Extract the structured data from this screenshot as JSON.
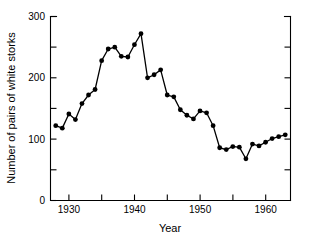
{
  "chart_data": {
    "type": "line",
    "title": "",
    "xlabel": "Year",
    "ylabel": "Number of pairs of white storks",
    "xlim": [
      1927.2,
      1963.8
    ],
    "ylim": [
      0,
      300
    ],
    "grid": false,
    "legend": null,
    "marker": "filled-circle",
    "line_color": "#000000",
    "marker_color": "#000000",
    "xticks": [
      1930,
      1935,
      1940,
      1945,
      1950,
      1955,
      1960
    ],
    "xtick_labels": [
      "1930",
      "",
      "1940",
      "",
      "1950",
      "",
      "1960"
    ],
    "yticks": [
      0,
      50,
      100,
      150,
      200,
      250,
      300
    ],
    "ytick_labels": [
      "0",
      "",
      "100",
      "",
      "200",
      "",
      "300"
    ],
    "x": [
      1928,
      1929,
      1930,
      1931,
      1932,
      1933,
      1934,
      1935,
      1936,
      1937,
      1938,
      1939,
      1940,
      1941,
      1942,
      1943,
      1944,
      1945,
      1946,
      1947,
      1948,
      1949,
      1950,
      1951,
      1952,
      1953,
      1954,
      1955,
      1956,
      1957,
      1958,
      1959,
      1960,
      1961,
      1962,
      1963
    ],
    "values": [
      122,
      118,
      141,
      132,
      158,
      172,
      181,
      228,
      247,
      250,
      235,
      234,
      254,
      272,
      200,
      205,
      213,
      172,
      169,
      148,
      139,
      133,
      146,
      143,
      122,
      86,
      83,
      88,
      87,
      68,
      92,
      89,
      95,
      101,
      104,
      107
    ],
    "series": [
      {
        "name": "White stork pairs",
        "values": [
          122,
          118,
          141,
          132,
          158,
          172,
          181,
          228,
          247,
          250,
          235,
          234,
          254,
          272,
          200,
          205,
          213,
          172,
          169,
          148,
          139,
          133,
          146,
          143,
          122,
          86,
          83,
          88,
          87,
          68,
          92,
          89,
          95,
          101,
          104,
          107
        ]
      }
    ],
    "annotations": []
  },
  "axes": {
    "y_title": "Number of pairs of white storks",
    "x_title": "Year",
    "y_labels": {
      "v300": "300",
      "v200": "200",
      "v100": "100",
      "v0": "0"
    },
    "x_labels": {
      "v1930": "1930",
      "v1940": "1940",
      "v1950": "1950",
      "v1960": "1960"
    }
  }
}
